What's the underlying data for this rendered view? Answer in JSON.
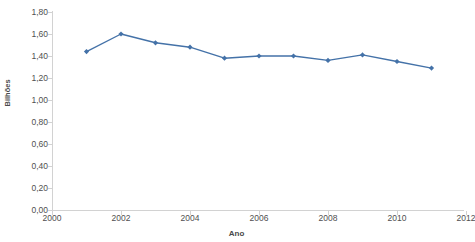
{
  "chart_data": {
    "type": "line",
    "title": "",
    "xlabel": "Ano",
    "ylabel": "Bilhões",
    "x": [
      2001,
      2002,
      2003,
      2004,
      2005,
      2006,
      2007,
      2008,
      2009,
      2010,
      2011
    ],
    "values": [
      1.44,
      1.6,
      1.52,
      1.48,
      1.38,
      1.4,
      1.4,
      1.36,
      1.41,
      1.35,
      1.29
    ],
    "series": [
      {
        "name": "Bilhões",
        "values": [
          1.44,
          1.6,
          1.52,
          1.48,
          1.38,
          1.4,
          1.4,
          1.36,
          1.41,
          1.35,
          1.29
        ]
      }
    ],
    "xlim": [
      2000,
      2012
    ],
    "ylim": [
      0.0,
      1.8
    ],
    "ytick_labels": [
      "0,00",
      "0,20",
      "0,40",
      "0,60",
      "0,80",
      "1,00",
      "1,20",
      "1,40",
      "1,60",
      "1,80"
    ],
    "ytick_values": [
      0.0,
      0.2,
      0.4,
      0.6,
      0.8,
      1.0,
      1.2,
      1.4,
      1.6,
      1.8
    ],
    "xtick_labels": [
      "2000",
      "2002",
      "2004",
      "2006",
      "2008",
      "2010",
      "2012"
    ],
    "xtick_values": [
      2000,
      2002,
      2004,
      2006,
      2008,
      2010,
      2012
    ],
    "grid": false,
    "legend": "none",
    "marker": "diamond",
    "series_color": "#4472a8",
    "axis_color": "#d2d2d2",
    "label_color": "#4f4f4f"
  }
}
